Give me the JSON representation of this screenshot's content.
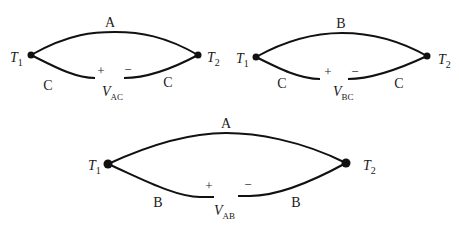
{
  "diagram": {
    "type": "thermocouple-circuits",
    "colors": {
      "wire": "#111111",
      "text": "#1a1a1a",
      "background": "#ffffff"
    },
    "circuits": [
      {
        "id": "AC",
        "top_wire": "A",
        "bottom_left_wire": "C",
        "bottom_right_wire": "C",
        "left_junction": {
          "symbol": "T",
          "sub": "1"
        },
        "right_junction": {
          "symbol": "T",
          "sub": "2"
        },
        "voltage": {
          "symbol": "V",
          "sub": "AC",
          "plus": "+",
          "minus": "−"
        }
      },
      {
        "id": "BC",
        "top_wire": "B",
        "bottom_left_wire": "C",
        "bottom_right_wire": "C",
        "left_junction": {
          "symbol": "T",
          "sub": "1"
        },
        "right_junction": {
          "symbol": "T",
          "sub": "2"
        },
        "voltage": {
          "symbol": "V",
          "sub": "BC",
          "plus": "+",
          "minus": "−"
        }
      },
      {
        "id": "AB",
        "top_wire": "A",
        "bottom_left_wire": "B",
        "bottom_right_wire": "B",
        "left_junction": {
          "symbol": "T",
          "sub": "1"
        },
        "right_junction": {
          "symbol": "T",
          "sub": "2"
        },
        "voltage": {
          "symbol": "V",
          "sub": "AB",
          "plus": "+",
          "minus": "−"
        }
      }
    ]
  }
}
